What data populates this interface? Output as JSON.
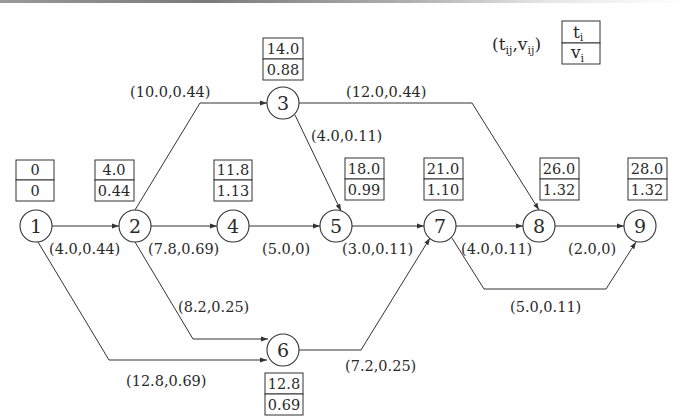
{
  "diagram": {
    "type": "activity-network",
    "legend": {
      "edge_label_format": "(t_ij,v_ij)",
      "edge_parts": {
        "t": "t",
        "t_sub": "ij",
        "v": "v",
        "v_sub": "ij"
      },
      "box_top": {
        "symbol": "t",
        "sub": "i"
      },
      "box_bottom": {
        "symbol": "v",
        "sub": "i"
      }
    },
    "nodes": [
      {
        "id": "1",
        "t": "0",
        "v": "0"
      },
      {
        "id": "2",
        "t": "4.0",
        "v": "0.44"
      },
      {
        "id": "3",
        "t": "14.0",
        "v": "0.88"
      },
      {
        "id": "4",
        "t": "11.8",
        "v": "1.13"
      },
      {
        "id": "5",
        "t": "18.0",
        "v": "0.99"
      },
      {
        "id": "6",
        "t": "12.8",
        "v": "0.69"
      },
      {
        "id": "7",
        "t": "21.0",
        "v": "1.10"
      },
      {
        "id": "8",
        "t": "26.0",
        "v": "1.32"
      },
      {
        "id": "9",
        "t": "28.0",
        "v": "1.32"
      }
    ],
    "edges": [
      {
        "from": "1",
        "to": "2",
        "label": "(4.0,0.44)"
      },
      {
        "from": "1",
        "to": "6",
        "label": "(12.8,0.69)"
      },
      {
        "from": "2",
        "to": "3",
        "label": "(10.0,0.44)"
      },
      {
        "from": "2",
        "to": "4",
        "label": "(7.8,0.69)"
      },
      {
        "from": "2",
        "to": "6",
        "label": "(8.2,0.25)"
      },
      {
        "from": "3",
        "to": "5",
        "label": "(4.0,0.11)"
      },
      {
        "from": "3",
        "to": "8",
        "label": "(12.0,0.44)"
      },
      {
        "from": "4",
        "to": "5",
        "label": "(5.0,0)"
      },
      {
        "from": "5",
        "to": "7",
        "label": "(3.0,0.11)"
      },
      {
        "from": "6",
        "to": "7",
        "label": "(7.2,0.25)"
      },
      {
        "from": "7",
        "to": "8",
        "label": "(4.0,0.11)"
      },
      {
        "from": "7",
        "to": "9",
        "label": "(5.0,0.11)"
      },
      {
        "from": "8",
        "to": "9",
        "label": "(2.0,0)"
      }
    ]
  }
}
